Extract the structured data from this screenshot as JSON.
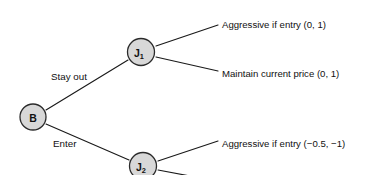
{
  "diagram": {
    "type": "extensive-form-game-tree",
    "background_color": "#ffffff",
    "line_color": "#1a1a1a",
    "node_fill_color": "#d8d8d8",
    "node_stroke_color": "#2b2b2b",
    "text_color": "#111111",
    "nodes": {
      "root": {
        "label": "B",
        "subscript": ""
      },
      "upper": {
        "label": "J",
        "subscript": "1"
      },
      "lower": {
        "label": "J",
        "subscript": "2"
      }
    },
    "edge_labels": {
      "stay_out": "Stay out",
      "enter": "Enter"
    },
    "outcomes": [
      {
        "text": "Aggressive if entry (0, 1)"
      },
      {
        "text": "Maintain current price (0, 1)"
      },
      {
        "text": "Aggressive if entry (−0.5, −1)"
      }
    ]
  }
}
